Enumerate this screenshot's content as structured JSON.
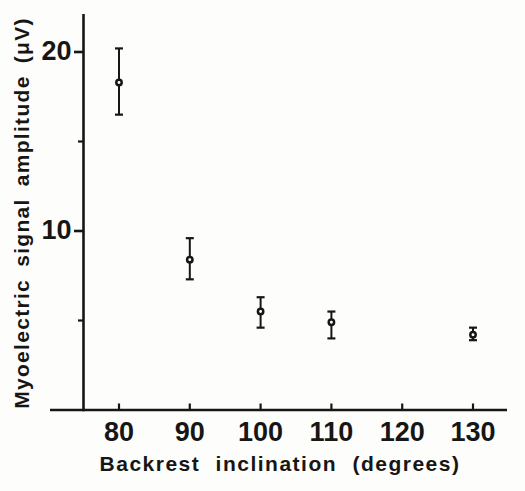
{
  "chart_data": {
    "type": "scatter",
    "title": "",
    "xlabel": "Backrest inclination (degrees)",
    "ylabel": "Myoelectric signal amplitude (μV)",
    "x_ticks": [
      80,
      90,
      100,
      110,
      120,
      130
    ],
    "y_major_ticks": [
      20,
      10
    ],
    "y_minor_ticks": [
      15,
      5
    ],
    "xlim": [
      70,
      135
    ],
    "ylim": [
      0,
      22
    ],
    "grid": false,
    "legend": "none",
    "marker": "open-circle",
    "error_bars": "vertical-with-caps",
    "series": [
      {
        "name": "myoelectric-amplitude-mean",
        "points": [
          {
            "x": 80,
            "y": 18.3,
            "y_hi": 20.2,
            "y_lo": 16.5
          },
          {
            "x": 90,
            "y": 8.4,
            "y_hi": 9.6,
            "y_lo": 7.3
          },
          {
            "x": 100,
            "y": 5.5,
            "y_hi": 6.3,
            "y_lo": 4.6
          },
          {
            "x": 110,
            "y": 4.9,
            "y_hi": 5.5,
            "y_lo": 4.0
          },
          {
            "x": 130,
            "y": 4.2,
            "y_hi": 4.6,
            "y_lo": 3.9
          }
        ]
      }
    ],
    "colors": {
      "ink": "#161616",
      "background": "#fdfdfb"
    }
  }
}
